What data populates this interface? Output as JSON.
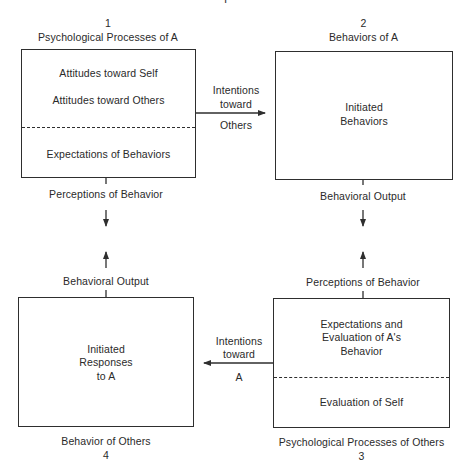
{
  "partial_title": "Model of Interpersonal Process",
  "boxes": {
    "box1": {
      "number": "1",
      "title": "Psychological Processes of A",
      "upper_lines": [
        "Attitudes toward Self",
        "Attitudes toward Others"
      ],
      "lower_lines": [
        "Expectations of Behaviors"
      ]
    },
    "box2": {
      "number": "2",
      "title": "Behaviors of A",
      "content_lines": [
        "Initiated",
        "Behaviors"
      ]
    },
    "box3": {
      "number": "3",
      "title": "Psychological Processes of Others",
      "upper_lines": [
        "Expectations and",
        "Evaluation of A's",
        "Behavior"
      ],
      "lower_lines": [
        "Evaluation of Self"
      ]
    },
    "box4": {
      "number": "4",
      "title": "Behavior of Others",
      "content_lines": [
        "Initiated",
        "Responses",
        "to A"
      ]
    }
  },
  "connectors": {
    "top_arrow": {
      "above": [
        "Intentions",
        "toward"
      ],
      "below": "Others"
    },
    "bottom_arrow": {
      "above": [
        "Intentions",
        "toward"
      ],
      "below": "A"
    },
    "left_down_label": "Perceptions of Behavior",
    "left_up_label": "Behavioral Output",
    "right_down_label": "Behavioral Output",
    "right_up_label": "Perceptions of Behavior"
  },
  "colors": {
    "line": "#2e2e2e",
    "text": "#2a2a2a",
    "background": "#ffffff"
  }
}
